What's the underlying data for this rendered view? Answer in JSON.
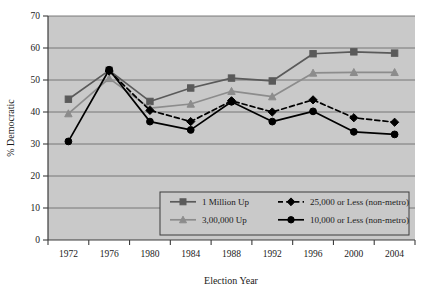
{
  "chart_data": {
    "type": "line",
    "title": "",
    "xlabel": "Election Year",
    "ylabel": "% Democratic",
    "categories": [
      "1972",
      "1976",
      "1980",
      "1984",
      "1988",
      "1992",
      "1996",
      "2000",
      "2004"
    ],
    "ylim": [
      0,
      70
    ],
    "yticks": [
      "0",
      "10",
      "20",
      "30",
      "40",
      "50",
      "60",
      "70"
    ],
    "grid": true,
    "legend_position": "inside-bottom-center",
    "series": [
      {
        "name": "1 Million Up",
        "marker": "square",
        "color": "#5a5a5a",
        "dash": "solid",
        "values": [
          44.0,
          53.0,
          43.3,
          47.5,
          50.6,
          49.7,
          58.2,
          58.8,
          58.4
        ]
      },
      {
        "name": "3,00,000 Up",
        "marker": "triangle",
        "color": "#8c8c8c",
        "dash": "solid",
        "values": [
          39.5,
          50.5,
          41.2,
          42.5,
          46.5,
          44.8,
          52.2,
          52.4,
          52.4
        ]
      },
      {
        "name": "25,000 or Less (non-metro)",
        "marker": "diamond",
        "color": "#000000",
        "dash": "dashed",
        "values": [
          null,
          52.8,
          40.5,
          37.0,
          43.5,
          40.0,
          43.8,
          38.2,
          36.8
        ]
      },
      {
        "name": "10,000 or Less (non-metro)",
        "marker": "circle",
        "color": "#000000",
        "dash": "solid",
        "values": [
          30.8,
          53.2,
          37.0,
          34.4,
          43.2,
          37.0,
          40.2,
          33.8,
          33.0
        ]
      }
    ]
  },
  "colors": {
    "plot_background": "#c9c9c9",
    "gridline": "#6e6e6e",
    "axis": "#3c3c3c",
    "text": "#1a1a1a",
    "legend_background": "#c9c9c9",
    "legend_border": "#3c3c3c"
  },
  "axes": {
    "y_label": "% Democratic",
    "x_label": "Election Year",
    "y_ticks": [
      "70",
      "60",
      "50",
      "40",
      "30",
      "20",
      "10",
      "0"
    ],
    "x_ticks": [
      "1972",
      "1976",
      "1980",
      "1984",
      "1988",
      "1992",
      "1996",
      "2000",
      "2004"
    ]
  },
  "legend": {
    "entries": [
      {
        "label": "1 Million Up",
        "marker": "square-marker-icon"
      },
      {
        "label": "25,000 or Less (non-metro)",
        "marker": "diamond-marker-icon"
      },
      {
        "label": "3,00,000 Up",
        "marker": "triangle-marker-icon"
      },
      {
        "label": "10,000 or Less (non-metro)",
        "marker": "circle-marker-icon"
      }
    ]
  }
}
